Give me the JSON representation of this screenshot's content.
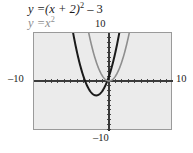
{
  "figure": {
    "title": "",
    "width": 193,
    "height": 153,
    "background_color": "#ffffff",
    "plot_fill_color": "#ebebeb",
    "plot_border_color": "#9a9a9a"
  },
  "captions": {
    "main": {
      "lhs": "y =",
      "body": "(x + 2)",
      "exponent": "2",
      "tail": " – 3",
      "full_text": "y = (x + 2)² – 3",
      "color": "#1c1c1c"
    },
    "parent": {
      "lhs": "y =",
      "body": "x",
      "exponent": "2",
      "tail": "",
      "full_text": "y = x²",
      "color": "#8e8e8e"
    }
  },
  "axes": {
    "x_label_left": "–10",
    "x_label_right": "10",
    "y_label_top": "10",
    "y_label_bottom": "–10",
    "xlim": [
      -10,
      10
    ],
    "ylim": [
      -10,
      10
    ],
    "origin_px": [
      108,
      80
    ],
    "tick_spacing": 1,
    "axis_color": "#3a3a3a"
  },
  "chart_data": {
    "type": "line",
    "title": "",
    "xlabel": "",
    "ylabel": "",
    "xlim": [
      -10,
      10
    ],
    "ylim": [
      -10,
      10
    ],
    "grid": false,
    "legend": "none",
    "tick_interval": 1,
    "annotations": [
      "y = (x + 2)² – 3",
      "y = x²"
    ],
    "series": [
      {
        "name": "y = (x + 2)² – 3",
        "color": "#1a1a1a",
        "linewidth": 2.0,
        "vertex": [
          -2,
          -3
        ],
        "roots": [
          -3.732,
          -0.268
        ],
        "x": [
          -6.0,
          -5.5,
          -5.0,
          -4.5,
          -4.0,
          -3.5,
          -3.0,
          -2.5,
          -2.0,
          -1.5,
          -1.0,
          -0.5,
          0.0,
          0.5,
          1.0,
          1.5,
          1.6
        ],
        "y": [
          13.0,
          9.25,
          6.0,
          3.25,
          1.0,
          -0.75,
          -2.0,
          -2.75,
          -3.0,
          -2.75,
          -2.0,
          -0.75,
          1.0,
          3.25,
          6.0,
          9.25,
          9.96
        ]
      },
      {
        "name": "y = x²",
        "color": "#8e8e8e",
        "linewidth": 1.6,
        "vertex": [
          0,
          0
        ],
        "roots": [
          0
        ],
        "x": [
          -3.6,
          -3.2,
          -2.8,
          -2.4,
          -2.0,
          -1.6,
          -1.2,
          -0.8,
          -0.4,
          0.0,
          0.4,
          0.8,
          1.2,
          1.6,
          2.0,
          2.4,
          2.8,
          3.2,
          3.6
        ],
        "y": [
          12.96,
          10.24,
          7.84,
          5.76,
          4.0,
          2.56,
          1.44,
          0.64,
          0.16,
          0.0,
          0.16,
          0.64,
          1.44,
          2.56,
          4.0,
          5.76,
          7.84,
          10.24,
          12.96
        ]
      }
    ]
  }
}
